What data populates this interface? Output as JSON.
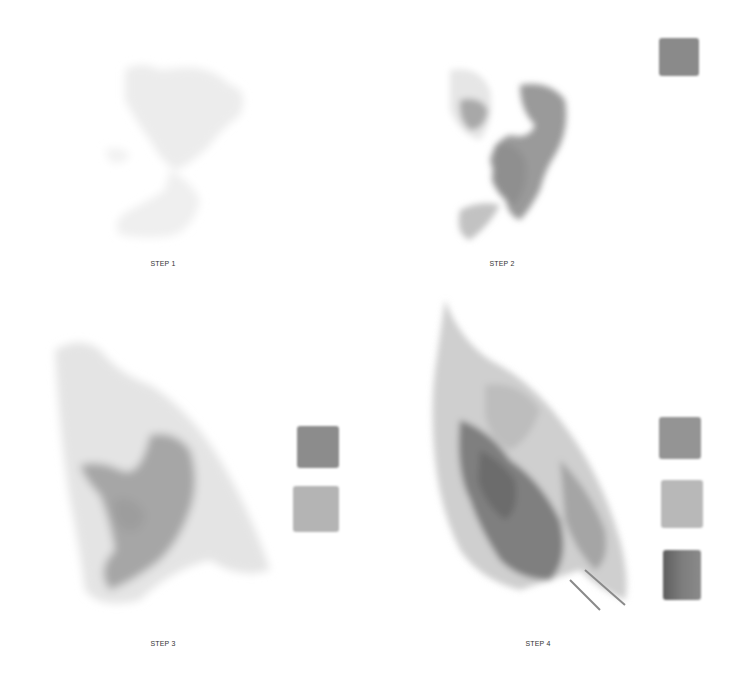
{
  "steps": [
    {
      "label": "STEP 1",
      "swatches": []
    },
    {
      "label": "STEP 2",
      "swatches": [
        {
          "color": "#8a8a8a"
        }
      ]
    },
    {
      "label": "STEP 3",
      "swatches": [
        {
          "color": "#8c8c8c"
        },
        {
          "color": "#b4b4b4"
        }
      ]
    },
    {
      "label": "STEP 4",
      "swatches": [
        {
          "color": "#949494"
        },
        {
          "color": "#b8b8b8"
        },
        {
          "color": "#6e6e6e"
        }
      ]
    }
  ]
}
